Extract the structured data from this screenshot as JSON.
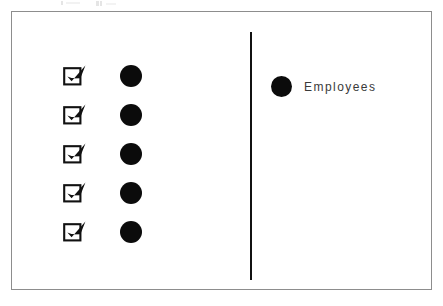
{
  "canvas": {
    "width": 443,
    "height": 306,
    "background_color": "#ffffff"
  },
  "frame": {
    "border_color": "#8d8d8d",
    "fill_color": "#ffffff"
  },
  "divider": {
    "name": "vertical-divider",
    "color": "#111111",
    "orientation": "vertical"
  },
  "checklist": {
    "checkbox_icon": "ballot-box-with-check-icon",
    "checkbox_glyph": "☑",
    "dot_icon": "filled-circle-icon",
    "dot_color": "#0b0b0b",
    "checked": true,
    "rows": [
      {
        "checked": true,
        "dot_color": "#0b0b0b"
      },
      {
        "checked": true,
        "dot_color": "#0b0b0b"
      },
      {
        "checked": true,
        "dot_color": "#0b0b0b"
      },
      {
        "checked": true,
        "dot_color": "#0b0b0b"
      },
      {
        "checked": true,
        "dot_color": "#0b0b0b"
      }
    ]
  },
  "legend": {
    "marker_icon": "filled-circle-icon",
    "marker_color": "#0b0b0b",
    "label": "Employees",
    "label_color": "#3a3a3a"
  }
}
